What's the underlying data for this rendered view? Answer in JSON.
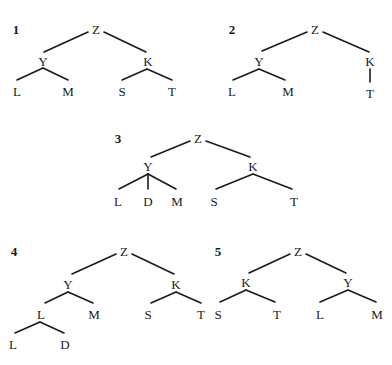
{
  "figure": {
    "colors": {
      "line": "#1a1a1a",
      "text": "#1a1a1a",
      "background": "#ffffff"
    }
  },
  "trees": [
    {
      "number": "1",
      "number_pos": [
        16,
        29
      ],
      "nodes": [
        {
          "id": "Z",
          "label": "Z",
          "pos": [
            96,
            29
          ]
        },
        {
          "id": "Y",
          "label": "Y",
          "pos": [
            43,
            61
          ]
        },
        {
          "id": "K",
          "label": "K",
          "pos": [
            148,
            61
          ]
        },
        {
          "id": "L",
          "label": "L",
          "pos": [
            17,
            91
          ]
        },
        {
          "id": "M",
          "label": "M",
          "pos": [
            68,
            91
          ]
        },
        {
          "id": "S",
          "label": "S",
          "pos": [
            122,
            91
          ]
        },
        {
          "id": "T",
          "label": "T",
          "pos": [
            172,
            91
          ]
        }
      ],
      "edges": [
        [
          [
            88,
            32
          ],
          [
            44,
            52
          ]
        ],
        [
          [
            104,
            32
          ],
          [
            146,
            52
          ]
        ],
        [
          [
            43,
            68
          ],
          [
            17,
            80
          ]
        ],
        [
          [
            43,
            68
          ],
          [
            68,
            80
          ]
        ],
        [
          [
            147,
            69
          ],
          [
            122,
            80
          ]
        ],
        [
          [
            147,
            69
          ],
          [
            172,
            80
          ]
        ]
      ]
    },
    {
      "number": "2",
      "number_pos": [
        232,
        29
      ],
      "nodes": [
        {
          "id": "Z",
          "label": "Z",
          "pos": [
            315,
            29
          ]
        },
        {
          "id": "Y",
          "label": "Y",
          "pos": [
            259,
            61
          ]
        },
        {
          "id": "K",
          "label": "K",
          "pos": [
            370,
            61
          ]
        },
        {
          "id": "L",
          "label": "L",
          "pos": [
            232,
            91
          ]
        },
        {
          "id": "M",
          "label": "M",
          "pos": [
            288,
            91
          ]
        },
        {
          "id": "T",
          "label": "T",
          "pos": [
            370,
            93
          ]
        }
      ],
      "edges": [
        [
          [
            307,
            32
          ],
          [
            262,
            51
          ]
        ],
        [
          [
            323,
            32
          ],
          [
            369,
            52
          ]
        ],
        [
          [
            259,
            69
          ],
          [
            233,
            80
          ]
        ],
        [
          [
            259,
            69
          ],
          [
            285,
            80
          ]
        ],
        [
          [
            370,
            69
          ],
          [
            370,
            82
          ]
        ]
      ]
    },
    {
      "number": "3",
      "number_pos": [
        118,
        138
      ],
      "nodes": [
        {
          "id": "Z",
          "label": "Z",
          "pos": [
            198,
            138
          ]
        },
        {
          "id": "Y",
          "label": "Y",
          "pos": [
            148,
            166
          ]
        },
        {
          "id": "K",
          "label": "K",
          "pos": [
            253,
            166
          ]
        },
        {
          "id": "L",
          "label": "L",
          "pos": [
            118,
            201
          ]
        },
        {
          "id": "D",
          "label": "D",
          "pos": [
            148,
            201
          ]
        },
        {
          "id": "M",
          "label": "M",
          "pos": [
            177,
            201
          ]
        },
        {
          "id": "S",
          "label": "S",
          "pos": [
            214,
            201
          ]
        },
        {
          "id": "T",
          "label": "T",
          "pos": [
            294,
            201
          ]
        }
      ],
      "edges": [
        [
          [
            190,
            141
          ],
          [
            151,
            157
          ]
        ],
        [
          [
            206,
            141
          ],
          [
            250,
            157
          ]
        ],
        [
          [
            148,
            174
          ],
          [
            119,
            189
          ]
        ],
        [
          [
            148,
            174
          ],
          [
            148,
            189
          ]
        ],
        [
          [
            148,
            174
          ],
          [
            176,
            189
          ]
        ],
        [
          [
            253,
            174
          ],
          [
            216,
            189
          ]
        ],
        [
          [
            253,
            174
          ],
          [
            292,
            189
          ]
        ]
      ]
    },
    {
      "number": "4",
      "number_pos": [
        14,
        251
      ],
      "nodes": [
        {
          "id": "Z",
          "label": "Z",
          "pos": [
            124,
            251
          ]
        },
        {
          "id": "Y",
          "label": "Y",
          "pos": [
            68,
            284
          ]
        },
        {
          "id": "K",
          "label": "K",
          "pos": [
            176,
            284
          ]
        },
        {
          "id": "L1",
          "label": "L",
          "pos": [
            41,
            314
          ]
        },
        {
          "id": "M",
          "label": "M",
          "pos": [
            94,
            314
          ]
        },
        {
          "id": "S",
          "label": "S",
          "pos": [
            148,
            314
          ]
        },
        {
          "id": "T",
          "label": "T",
          "pos": [
            201,
            314
          ]
        },
        {
          "id": "L2",
          "label": "L",
          "pos": [
            13,
            344
          ]
        },
        {
          "id": "D",
          "label": "D",
          "pos": [
            65,
            344
          ]
        }
      ],
      "edges": [
        [
          [
            116,
            254
          ],
          [
            72,
            274
          ]
        ],
        [
          [
            132,
            254
          ],
          [
            174,
            274
          ]
        ],
        [
          [
            68,
            292
          ],
          [
            45,
            303
          ]
        ],
        [
          [
            68,
            292
          ],
          [
            93,
            303
          ]
        ],
        [
          [
            176,
            292
          ],
          [
            151,
            303
          ]
        ],
        [
          [
            176,
            292
          ],
          [
            201,
            303
          ]
        ],
        [
          [
            40,
            322
          ],
          [
            15,
            333
          ]
        ],
        [
          [
            40,
            322
          ],
          [
            64,
            333
          ]
        ]
      ]
    },
    {
      "number": "5",
      "number_pos": [
        218,
        251
      ],
      "nodes": [
        {
          "id": "Z",
          "label": "Z",
          "pos": [
            298,
            251
          ]
        },
        {
          "id": "K",
          "label": "K",
          "pos": [
            246,
            282
          ]
        },
        {
          "id": "Y",
          "label": "Y",
          "pos": [
            348,
            282
          ]
        },
        {
          "id": "S",
          "label": "S",
          "pos": [
            218,
            314
          ]
        },
        {
          "id": "T",
          "label": "T",
          "pos": [
            277,
            314
          ]
        },
        {
          "id": "L",
          "label": "L",
          "pos": [
            320,
            314
          ]
        },
        {
          "id": "M",
          "label": "M",
          "pos": [
            377,
            314
          ]
        }
      ],
      "edges": [
        [
          [
            290,
            254
          ],
          [
            249,
            273
          ]
        ],
        [
          [
            306,
            254
          ],
          [
            346,
            273
          ]
        ],
        [
          [
            246,
            290
          ],
          [
            220,
            302
          ]
        ],
        [
          [
            246,
            290
          ],
          [
            275,
            302
          ]
        ],
        [
          [
            348,
            290
          ],
          [
            320,
            302
          ]
        ],
        [
          [
            348,
            290
          ],
          [
            376,
            302
          ]
        ]
      ]
    }
  ]
}
